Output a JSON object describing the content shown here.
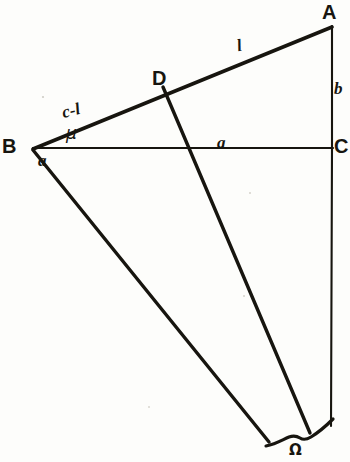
{
  "figure": {
    "background_color": "#fdfdfb",
    "ink_color": "#17150f",
    "width": 350,
    "height": 462
  },
  "vertices": {
    "A": "A",
    "B": "B",
    "C": "C",
    "D": "D"
  },
  "segment_labels": {
    "l": "l",
    "c_minus_l": "c-l",
    "mu": "μ",
    "alpha_at_B": "a",
    "a_on_BC": "a",
    "b_on_AC": "b",
    "omega": "Ω"
  },
  "geometry": {
    "points": {
      "A": [
        332,
        25
      ],
      "B": [
        32,
        148
      ],
      "C": [
        332,
        148
      ],
      "D": [
        163,
        87
      ],
      "D_end": [
        310,
        432
      ],
      "B_ray_end": [
        268,
        441
      ],
      "C_vertical_end": [
        331,
        425
      ]
    },
    "lines": [
      {
        "name": "BA",
        "from": "B",
        "to": "A"
      },
      {
        "name": "BC",
        "from": "B",
        "to": "C"
      },
      {
        "name": "AC",
        "from": "A",
        "to": "C"
      },
      {
        "name": "D-ray",
        "from": "D",
        "to": "D_end"
      },
      {
        "name": "B-ray",
        "from": "B",
        "to": "B_ray_end"
      },
      {
        "name": "C-extension",
        "from": "C",
        "to": "C_vertical_end"
      }
    ],
    "brace": {
      "left": 265,
      "right": 336,
      "y": 437
    }
  }
}
